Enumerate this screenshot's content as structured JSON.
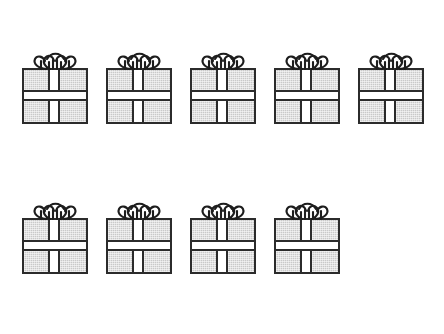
{
  "page": {
    "background_color": "#ffffff",
    "width": 444,
    "height": 334
  },
  "style": {
    "box_fill_color": "#c9c9c9",
    "box_outline_color": "#2b2b2b",
    "ribbon_color": "#ffffff"
  },
  "objects": {
    "item_name": "gift-box",
    "total_count": 9,
    "rows": [
      {
        "row_name": "top-row",
        "count": 5,
        "y": 49,
        "items": [
          {
            "label": "gift-box-1",
            "x": 22
          },
          {
            "label": "gift-box-2",
            "x": 106
          },
          {
            "label": "gift-box-3",
            "x": 190
          },
          {
            "label": "gift-box-4",
            "x": 274
          },
          {
            "label": "gift-box-5",
            "x": 358
          }
        ]
      },
      {
        "row_name": "bottom-row",
        "count": 4,
        "y": 199,
        "items": [
          {
            "label": "gift-box-6",
            "x": 22
          },
          {
            "label": "gift-box-7",
            "x": 106
          },
          {
            "label": "gift-box-8",
            "x": 190
          },
          {
            "label": "gift-box-9",
            "x": 274
          }
        ]
      }
    ]
  }
}
